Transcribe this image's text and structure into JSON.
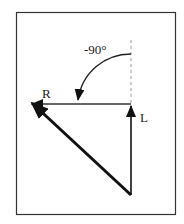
{
  "diagram": {
    "angle_label": "-90°",
    "vector_labels": {
      "right": "R",
      "left": "L"
    },
    "colors": {
      "stroke": "#222222",
      "frame": "#333333",
      "dashed": "#999999",
      "background": "#ffffff"
    }
  }
}
